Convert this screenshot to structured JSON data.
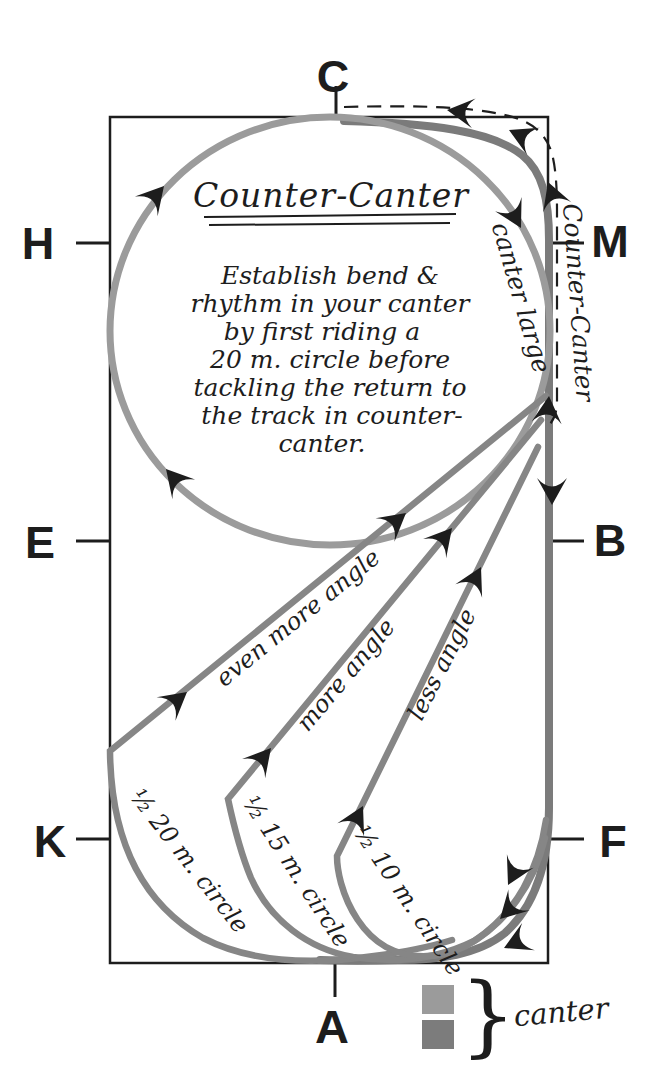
{
  "colors": {
    "ink": "#1d1d1d",
    "circle_gray": "#9b9b9b",
    "path_gray": "#868686",
    "track_gray": "#7b7b7b",
    "legend_light": "#9b9b9b",
    "legend_dark": "#7c7c7c",
    "paper": "#ffffff"
  },
  "letters": {
    "c": "C",
    "h": "H",
    "m": "M",
    "e": "E",
    "b": "B",
    "k": "K",
    "f": "F",
    "a": "A"
  },
  "title": "Counter-Canter",
  "note_lines": [
    "Establish bend &",
    "rhythm in your canter",
    "by first riding a",
    "20 m. circle before",
    "tackling the return to",
    "the track in counter-",
    "canter."
  ],
  "labels": {
    "canter_large": "canter large",
    "counter_canter": "Counter-Canter",
    "even_more_angle": "even more angle",
    "more_angle": "more angle",
    "less_angle": "less angle",
    "half_20": "½ 20 m. circle",
    "half_15": "½ 15 m. circle",
    "half_10": "½ 10 m. circle"
  },
  "legend": {
    "label": "canter",
    "brace": "}"
  }
}
